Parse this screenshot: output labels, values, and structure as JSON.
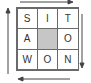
{
  "puzzle": {
    "grid": [
      [
        {
          "letter": "S",
          "shaded": false
        },
        {
          "letter": "I",
          "shaded": false
        },
        {
          "letter": "T",
          "shaded": false
        }
      ],
      [
        {
          "letter": "A",
          "shaded": false
        },
        {
          "letter": "",
          "shaded": true
        },
        {
          "letter": "O",
          "shaded": false
        }
      ],
      [
        {
          "letter": "W",
          "shaded": false
        },
        {
          "letter": "O",
          "shaded": false
        },
        {
          "letter": "N",
          "shaded": false
        }
      ]
    ],
    "arrows": [
      {
        "side": "top",
        "direction": "right"
      },
      {
        "side": "right",
        "direction": "down"
      },
      {
        "side": "bottom",
        "direction": "left"
      },
      {
        "side": "left",
        "direction": "up"
      }
    ],
    "colors": {
      "line": "#6a6a6a",
      "shade": "#c6c6c6",
      "text": "#333333"
    }
  }
}
